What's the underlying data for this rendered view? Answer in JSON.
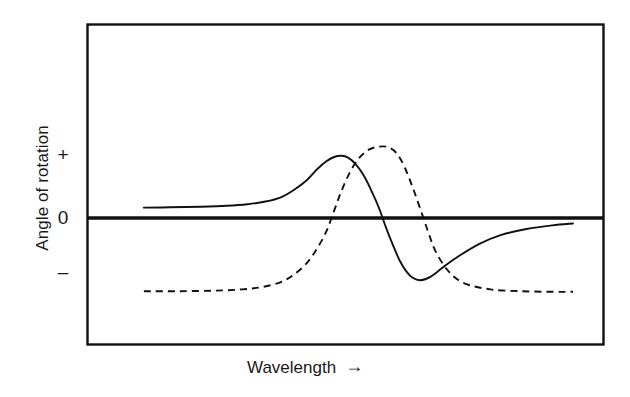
{
  "chart_data": {
    "type": "line",
    "title": "",
    "subtitle": "",
    "xlabel": "Wavelength",
    "ylabel": "Angle of rotation",
    "xlabel_suffix_icon": "right-arrow-icon",
    "xlabel_arrow": "→",
    "grid": false,
    "legend": "none",
    "axis_box": true,
    "zero_line": true,
    "x_tick_labels": [],
    "y_tick_labels": [
      "+",
      "0",
      "–"
    ],
    "ylim": [
      -1.35,
      1.35
    ],
    "xlim": [
      0,
      1
    ],
    "annotations": [],
    "series": [
      {
        "name": "optical-rotatory-dispersion-curve",
        "style": "solid",
        "color": "#111111",
        "description": "Positive Cotton effect ORD curve: rises to a positive peak, crosses zero, falls to a negative trough, then returns toward zero.",
        "x": [
          0.11,
          0.16,
          0.22,
          0.27,
          0.31,
          0.345,
          0.375,
          0.4,
          0.425,
          0.445,
          0.463,
          0.478,
          0.492,
          0.505,
          0.52,
          0.535,
          0.55,
          0.565,
          0.578,
          0.592,
          0.605,
          0.618,
          0.63,
          0.645,
          0.665,
          0.69,
          0.72,
          0.76,
          0.8,
          0.85,
          0.9,
          0.94
        ],
        "y": [
          0.17,
          0.175,
          0.185,
          0.2,
          0.225,
          0.27,
          0.34,
          0.46,
          0.62,
          0.8,
          0.93,
          1.0,
          1.02,
          0.99,
          0.88,
          0.7,
          0.45,
          0.16,
          -0.15,
          -0.45,
          -0.7,
          -0.88,
          -0.98,
          -1.02,
          -0.96,
          -0.8,
          -0.62,
          -0.42,
          -0.28,
          -0.18,
          -0.12,
          -0.09
        ],
        "markers": {
          "peak": {
            "x": 0.492,
            "y": 1.02
          },
          "trough": {
            "x": 0.645,
            "y": -1.02
          },
          "zero_crossing": {
            "x": 0.572,
            "y": 0.0
          }
        }
      },
      {
        "name": "circular-dichroism-absorption-band",
        "style": "dashed",
        "color": "#111111",
        "description": "Single Gaussian-like absorption/CD band peaking between the ORD peak and trough.",
        "x": [
          0.11,
          0.18,
          0.25,
          0.3,
          0.34,
          0.375,
          0.4,
          0.425,
          0.445,
          0.463,
          0.478,
          0.492,
          0.508,
          0.525,
          0.545,
          0.565,
          0.583,
          0.6,
          0.615,
          0.63,
          0.645,
          0.66,
          0.675,
          0.7,
          0.73,
          0.78,
          0.84,
          0.9,
          0.94
        ],
        "y": [
          -1.2,
          -1.2,
          -1.19,
          -1.17,
          -1.13,
          -1.05,
          -0.93,
          -0.74,
          -0.5,
          -0.22,
          0.12,
          0.44,
          0.74,
          0.97,
          1.12,
          1.17,
          1.16,
          1.05,
          0.82,
          0.5,
          0.14,
          -0.23,
          -0.56,
          -0.88,
          -1.07,
          -1.17,
          -1.2,
          -1.21,
          -1.21
        ],
        "markers": {
          "peak": {
            "x": 0.565,
            "y": 1.17
          },
          "baseline": -1.2
        }
      }
    ],
    "colors": {
      "ink": "#111111",
      "background": "#ffffff",
      "axis": "#111111",
      "zero_line": "#111111"
    }
  }
}
